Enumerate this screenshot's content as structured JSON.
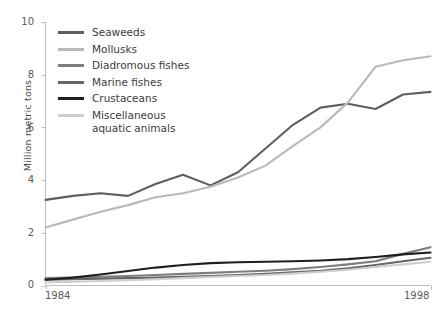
{
  "chart_data": {
    "type": "line",
    "title": "",
    "xlabel": "",
    "ylabel": "Million metric tons",
    "xlim": [
      1984,
      1998
    ],
    "ylim": [
      0,
      10
    ],
    "yticks": [
      0,
      2,
      4,
      6,
      8,
      10
    ],
    "xticks": [
      1984,
      1998
    ],
    "xtick_labels": [
      "1984",
      "1998"
    ],
    "grid": false,
    "legend_position": "top-left-inside",
    "x": [
      1984,
      1985,
      1986,
      1987,
      1988,
      1989,
      1990,
      1991,
      1992,
      1993,
      1994,
      1995,
      1996,
      1997,
      1998
    ],
    "series": [
      {
        "name": "Seaweeds",
        "color": "#5e5e5e",
        "values": [
          3.25,
          3.4,
          3.5,
          3.4,
          3.85,
          4.2,
          3.8,
          4.3,
          5.2,
          6.1,
          6.75,
          6.9,
          6.7,
          7.25,
          7.35
        ]
      },
      {
        "name": "Mollusks",
        "color": "#b9b9b9",
        "values": [
          2.2,
          2.5,
          2.8,
          3.05,
          3.35,
          3.5,
          3.75,
          4.1,
          4.55,
          5.3,
          6.0,
          6.95,
          8.3,
          8.55,
          8.7
        ]
      },
      {
        "name": "Diadromous fishes",
        "color": "#7d7d7d",
        "values": [
          0.28,
          0.3,
          0.33,
          0.36,
          0.4,
          0.44,
          0.48,
          0.52,
          0.56,
          0.62,
          0.7,
          0.8,
          0.92,
          1.2,
          1.45
        ]
      },
      {
        "name": "Marine fishes",
        "color": "#666666",
        "values": [
          0.22,
          0.24,
          0.26,
          0.28,
          0.3,
          0.33,
          0.36,
          0.4,
          0.44,
          0.5,
          0.56,
          0.65,
          0.78,
          0.92,
          1.05
        ]
      },
      {
        "name": "Crustaceans",
        "color": "#1f1f1f",
        "values": [
          0.22,
          0.3,
          0.42,
          0.55,
          0.68,
          0.78,
          0.85,
          0.88,
          0.9,
          0.92,
          0.95,
          1.0,
          1.08,
          1.18,
          1.25
        ]
      },
      {
        "name": "Miscellaneous\naquatic animals",
        "color": "#cfcfcf",
        "values": [
          0.12,
          0.14,
          0.17,
          0.2,
          0.24,
          0.28,
          0.32,
          0.36,
          0.4,
          0.45,
          0.52,
          0.6,
          0.7,
          0.8,
          0.9
        ]
      }
    ]
  },
  "axis": {
    "y_title": "Million metric tons",
    "y_tick_0": "0",
    "y_tick_2": "2",
    "y_tick_4": "4",
    "y_tick_6": "6",
    "y_tick_8": "8",
    "y_tick_10": "10",
    "x_tick_start": "1984",
    "x_tick_end": "1998"
  },
  "legend": {
    "items": [
      {
        "label": "Seaweeds"
      },
      {
        "label": "Mollusks"
      },
      {
        "label": "Diadromous fishes"
      },
      {
        "label": "Marine fishes"
      },
      {
        "label": "Crustaceans"
      },
      {
        "label": "Miscellaneous\naquatic animals"
      }
    ]
  },
  "style": {
    "axis_color": "#bdbdbd",
    "tick_text_color": "#5a5a5a",
    "background": "#ffffff"
  }
}
